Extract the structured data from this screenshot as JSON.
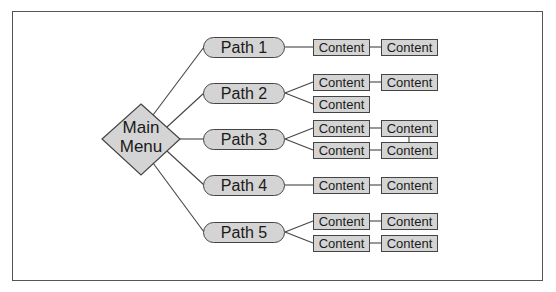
{
  "diagram": {
    "root": {
      "label_line1": "Main",
      "label_line2": "Menu",
      "shape": "diamond"
    },
    "paths": [
      {
        "label": "Path 1",
        "content": [
          [
            "Content",
            "Content"
          ]
        ]
      },
      {
        "label": "Path 2",
        "content": [
          [
            "Content",
            "Content"
          ],
          [
            "Content"
          ]
        ]
      },
      {
        "label": "Path 3",
        "content": [
          [
            "Content",
            "Content"
          ],
          [
            "Content",
            "Content"
          ]
        ]
      },
      {
        "label": "Path 4",
        "content": [
          [
            "Content",
            "Content"
          ]
        ]
      },
      {
        "label": "Path 5",
        "content": [
          [
            "Content",
            "Content"
          ],
          [
            "Content",
            "Content"
          ]
        ]
      }
    ],
    "colors": {
      "fill": "#d4d4d4",
      "stroke": "#444444",
      "background": "#ffffff",
      "frame": "#555555"
    }
  }
}
